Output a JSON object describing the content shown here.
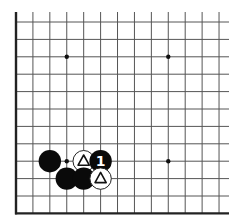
{
  "board": {
    "description": "Go board fragment (lower-left corner region)",
    "columns": 13,
    "rows": 12,
    "origin_x": 16,
    "origin_y": 22,
    "spacing_x": 16.92,
    "spacing_y": 17.4,
    "line_extent_top": 12,
    "line_extent_right": 229,
    "edges": [
      "left",
      "bottom"
    ],
    "colors": {
      "background": "#ffffff",
      "grid": "#555555",
      "edge": "#222222",
      "black_stone": "#0a0a0a",
      "white_stone": "#ffffff",
      "stone_outline": "#222222"
    },
    "star_points": [
      {
        "col": 3,
        "row": 2
      },
      {
        "col": 9,
        "row": 2
      },
      {
        "col": 3,
        "row": 8
      },
      {
        "col": 9,
        "row": 8
      }
    ],
    "stones": [
      {
        "col": 2,
        "row": 8,
        "color": "black",
        "marker": null,
        "label": ""
      },
      {
        "col": 4,
        "row": 8,
        "color": "white",
        "marker": "triangle",
        "label": ""
      },
      {
        "col": 5,
        "row": 8,
        "color": "black",
        "marker": "number",
        "label": "1"
      },
      {
        "col": 3,
        "row": 9,
        "color": "black",
        "marker": null,
        "label": ""
      },
      {
        "col": 4,
        "row": 9,
        "color": "black",
        "marker": null,
        "label": ""
      },
      {
        "col": 5,
        "row": 9,
        "color": "white",
        "marker": "triangle",
        "label": ""
      }
    ]
  }
}
